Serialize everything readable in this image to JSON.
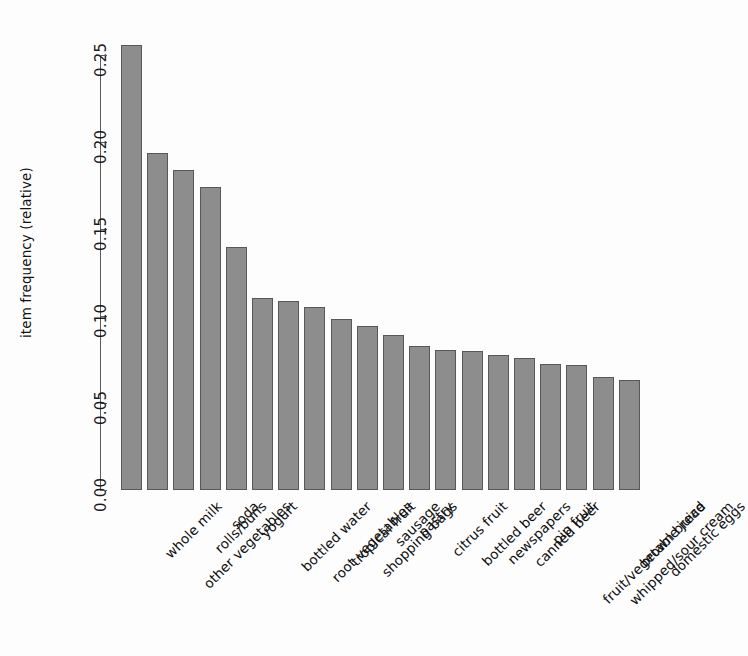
{
  "chart_data": {
    "type": "bar",
    "title": "",
    "subtitle": "",
    "xlabel": "",
    "ylabel": "item frequency (relative)",
    "ylim": [
      0.0,
      0.2555
    ],
    "grid": false,
    "legend": null,
    "bar_color": "#8d8d8d",
    "bar_border_color": "#585858",
    "background_color": "#fdfdfd",
    "axis_color": "#5b5b5b",
    "label_rotation_degrees": 45,
    "y_ticks": [
      0.0,
      0.05,
      0.1,
      0.15,
      0.2,
      0.25
    ],
    "y_tick_labels": [
      "0.00",
      "0.05",
      "0.10",
      "0.15",
      "0.20",
      "0.25"
    ],
    "categories": [
      "whole milk",
      "other vegetables",
      "rolls/buns",
      "soda",
      "yogurt",
      "bottled water",
      "root vegetables",
      "tropical fruit",
      "shopping bags",
      "sausage",
      "pastry",
      "citrus fruit",
      "bottled beer",
      "newspapers",
      "canned beer",
      "pip fruit",
      "fruit/vegetable juice",
      "whipped/sour cream",
      "brown bread",
      "domestic eggs"
    ],
    "values": [
      0.2555,
      0.1935,
      0.1839,
      0.1744,
      0.1395,
      0.1105,
      0.1089,
      0.1049,
      0.0985,
      0.094,
      0.0889,
      0.0828,
      0.0805,
      0.0799,
      0.0777,
      0.0757,
      0.0723,
      0.0717,
      0.0649,
      0.0634
    ]
  },
  "axis": {
    "y_title": "item frequency (relative)"
  }
}
